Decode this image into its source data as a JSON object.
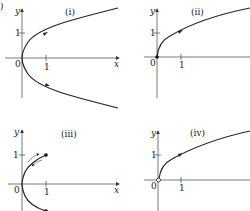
{
  "figure": {
    "corner_label": ")",
    "axis_x_label": "x",
    "axis_y_label": "y",
    "origin_label": "0",
    "tick_label_x": "1",
    "tick_label_y": "1",
    "panels": [
      {
        "id": "i",
        "title": "(i)",
        "description": "Parabola x = y^2 opening right, both branches with direction arrows"
      },
      {
        "id": "ii",
        "title": "(ii)",
        "description": "Upper branch y = sqrt(x) starting at filled dot at origin"
      },
      {
        "id": "iii",
        "title": "(iii)",
        "description": "Parabola segment x = y^2 for -1<=y<=1 with endpoints dots and back-and-forth arrows"
      },
      {
        "id": "iv",
        "title": "(iv)",
        "description": "Upper branch y = sqrt(x) starting at open circle at origin"
      }
    ]
  }
}
